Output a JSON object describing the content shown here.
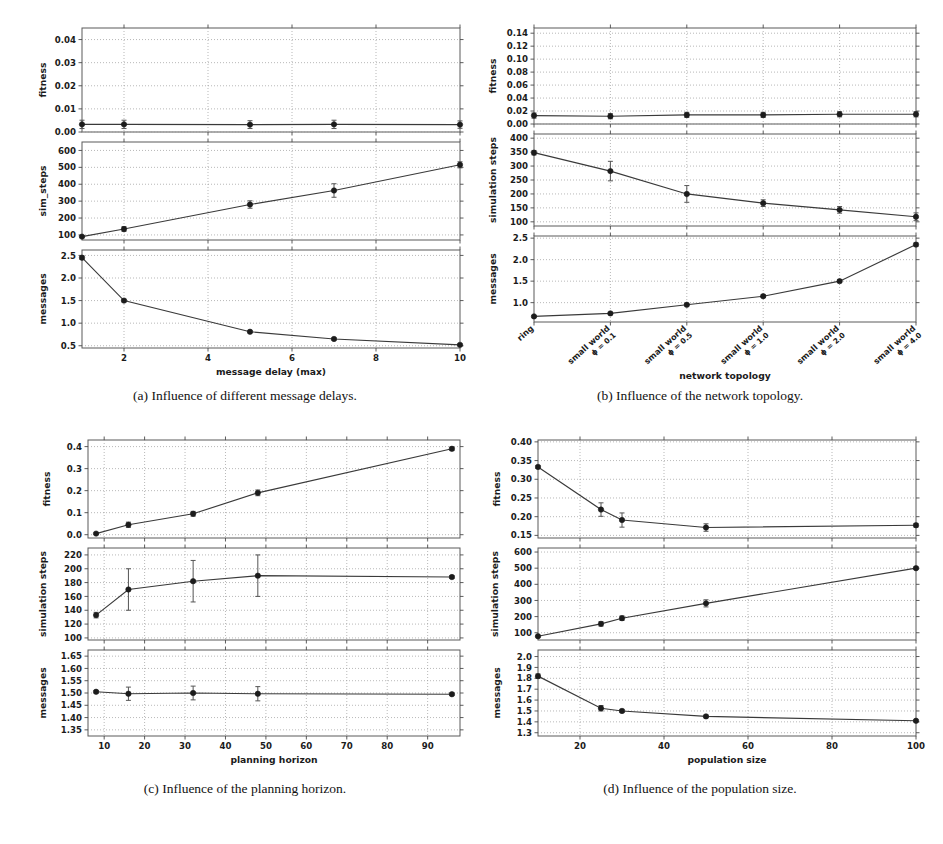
{
  "figure": {
    "subfigures": [
      {
        "id": "a",
        "caption": "(a) Influence of different message delays.",
        "xlabel": "message delay (max)",
        "panels": [
          "fitness",
          "sim_steps",
          "messages"
        ]
      },
      {
        "id": "b",
        "caption": "(b) Influence of the network topology.",
        "xlabel": "network topology",
        "panels": [
          "fitness",
          "simulation steps",
          "messages"
        ]
      },
      {
        "id": "c",
        "caption": "(c) Influence of the planning horizon.",
        "xlabel": "planning horizon",
        "panels": [
          "fitness",
          "simulation steps",
          "messages"
        ]
      },
      {
        "id": "d",
        "caption": "(d) Influence of the population size.",
        "xlabel": "population size",
        "panels": [
          "fitness",
          "simulation steps",
          "messages"
        ]
      }
    ]
  },
  "chart_data": [
    {
      "id": "a-fitness",
      "type": "line",
      "title": "",
      "xlabel": "",
      "ylabel": "fitness",
      "x": [
        1,
        2,
        5,
        7,
        10
      ],
      "values": [
        0.0033,
        0.0033,
        0.0032,
        0.0033,
        0.0032
      ],
      "yerr": [
        0.0018,
        0.0018,
        0.0017,
        0.0018,
        0.0016
      ],
      "xlim": [
        1,
        10
      ],
      "ylim": [
        0.0,
        0.045
      ],
      "yticks": [
        0.0,
        0.01,
        0.02,
        0.03,
        0.04
      ],
      "ytick_labels": [
        "0.00",
        "0.01",
        "0.02",
        "0.03",
        "0.04"
      ],
      "xticks": [
        2,
        4,
        6,
        8,
        10
      ],
      "xtick_labels": [
        "",
        "",
        "",
        "",
        ""
      ],
      "grid": true
    },
    {
      "id": "a-simsteps",
      "type": "line",
      "title": "",
      "xlabel": "",
      "ylabel": "sim_steps",
      "x": [
        1,
        2,
        5,
        7,
        10
      ],
      "values": [
        90,
        135,
        280,
        363,
        515
      ],
      "yerr": [
        6,
        14,
        22,
        40,
        18
      ],
      "xlim": [
        1,
        10
      ],
      "ylim": [
        70,
        650
      ],
      "yticks": [
        100,
        200,
        300,
        400,
        500,
        600
      ],
      "ytick_labels": [
        "100",
        "200",
        "300",
        "400",
        "500",
        "600"
      ],
      "xticks": [
        2,
        4,
        6,
        8,
        10
      ],
      "xtick_labels": [
        "",
        "",
        "",
        "",
        ""
      ],
      "grid": true
    },
    {
      "id": "a-messages",
      "type": "line",
      "title": "",
      "xlabel": "message delay (max)",
      "ylabel": "messages",
      "x": [
        1,
        2,
        5,
        7,
        10
      ],
      "values": [
        2.45,
        1.5,
        0.81,
        0.65,
        0.52
      ],
      "yerr": [
        0.04,
        0.03,
        0.02,
        0.02,
        0.02
      ],
      "xlim": [
        1,
        10
      ],
      "ylim": [
        0.45,
        2.62
      ],
      "yticks": [
        0.5,
        1.0,
        1.5,
        2.0,
        2.5
      ],
      "ytick_labels": [
        "0.5",
        "1.0",
        "1.5",
        "2.0",
        "2.5"
      ],
      "xticks": [
        2,
        4,
        6,
        8,
        10
      ],
      "xtick_labels": [
        "2",
        "4",
        "6",
        "8",
        "10"
      ],
      "grid": true
    },
    {
      "id": "b-fitness",
      "type": "line",
      "title": "",
      "xlabel": "",
      "ylabel": "fitness",
      "categories": [
        "ring",
        "small world\nφ = 0.1",
        "small world\nφ = 0.5",
        "small world\nφ = 1.0",
        "small world\nφ = 2.0",
        "small world\nφ = 4.0"
      ],
      "x": [
        0,
        1,
        2,
        3,
        4,
        5
      ],
      "values": [
        0.013,
        0.012,
        0.014,
        0.014,
        0.015,
        0.015
      ],
      "yerr": [
        0.004,
        0.004,
        0.004,
        0.004,
        0.004,
        0.004
      ],
      "xlim": [
        0,
        5
      ],
      "ylim": [
        0.0,
        0.148
      ],
      "yticks": [
        0.0,
        0.02,
        0.04,
        0.06,
        0.08,
        0.1,
        0.12,
        0.14
      ],
      "ytick_labels": [
        "0.00",
        "0.02",
        "0.04",
        "0.06",
        "0.08",
        "0.10",
        "0.12",
        "0.14"
      ],
      "grid": true
    },
    {
      "id": "b-simsteps",
      "type": "line",
      "title": "",
      "xlabel": "",
      "ylabel": "simulation steps",
      "x": [
        0,
        1,
        2,
        3,
        4,
        5
      ],
      "values": [
        348,
        282,
        200,
        167,
        143,
        118
      ],
      "yerr": [
        8,
        35,
        30,
        12,
        12,
        14
      ],
      "xlim": [
        0,
        5
      ],
      "ylim": [
        85,
        415
      ],
      "yticks": [
        100,
        150,
        200,
        250,
        300,
        350,
        400
      ],
      "ytick_labels": [
        "100",
        "150",
        "200",
        "250",
        "300",
        "350",
        "400"
      ],
      "grid": true
    },
    {
      "id": "b-messages",
      "type": "line",
      "title": "",
      "xlabel": "network topology",
      "ylabel": "messages",
      "x": [
        0,
        1,
        2,
        3,
        4,
        5
      ],
      "values": [
        0.68,
        0.75,
        0.95,
        1.15,
        1.5,
        2.35
      ],
      "yerr": [
        0.02,
        0.02,
        0.02,
        0.03,
        0.03,
        0.04
      ],
      "xlim": [
        0,
        5
      ],
      "ylim": [
        0.55,
        2.55
      ],
      "yticks": [
        1.0,
        1.5,
        2.0,
        2.5
      ],
      "ytick_labels": [
        "1.0",
        "1.5",
        "2.0",
        "2.5"
      ],
      "xtick_labels": [
        "ring",
        "small world",
        "small world",
        "small world",
        "small world",
        "small world"
      ],
      "xtick_sublabels": [
        "",
        "ϕ = 0.1",
        "ϕ = 0.5",
        "ϕ = 1.0",
        "ϕ = 2.0",
        "ϕ = 4.0"
      ],
      "grid": true
    },
    {
      "id": "c-fitness",
      "type": "line",
      "title": "",
      "xlabel": "",
      "ylabel": "fitness",
      "x": [
        8,
        16,
        32,
        48,
        96
      ],
      "values": [
        0.005,
        0.045,
        0.095,
        0.19,
        0.39
      ],
      "yerr": [
        0.004,
        0.012,
        0.011,
        0.013,
        0.008
      ],
      "xlim": [
        6,
        98
      ],
      "ylim": [
        -0.015,
        0.43
      ],
      "yticks": [
        0.0,
        0.1,
        0.2,
        0.3,
        0.4
      ],
      "ytick_labels": [
        "0.0",
        "0.1",
        "0.2",
        "0.3",
        "0.4"
      ],
      "xticks": [
        10,
        20,
        30,
        40,
        50,
        60,
        70,
        80,
        90
      ],
      "grid": true
    },
    {
      "id": "c-simsteps",
      "type": "line",
      "title": "",
      "xlabel": "",
      "ylabel": "simulation steps",
      "x": [
        8,
        16,
        32,
        48,
        96
      ],
      "values": [
        133,
        170,
        182,
        190,
        188
      ],
      "yerr": [
        4,
        30,
        30,
        30,
        2
      ],
      "xlim": [
        6,
        98
      ],
      "ylim": [
        97,
        230
      ],
      "yticks": [
        100,
        120,
        140,
        160,
        180,
        200,
        220
      ],
      "ytick_labels": [
        "100",
        "120",
        "140",
        "160",
        "180",
        "200",
        "220"
      ],
      "xticks": [
        10,
        20,
        30,
        40,
        50,
        60,
        70,
        80,
        90
      ],
      "grid": true
    },
    {
      "id": "c-messages",
      "type": "line",
      "title": "",
      "xlabel": "planning horizon",
      "ylabel": "messages",
      "x": [
        8,
        16,
        32,
        48,
        96
      ],
      "values": [
        1.505,
        1.497,
        1.5,
        1.497,
        1.495
      ],
      "yerr": [
        0.005,
        0.027,
        0.028,
        0.029,
        0.005
      ],
      "xlim": [
        6,
        98
      ],
      "ylim": [
        1.325,
        1.675
      ],
      "yticks": [
        1.35,
        1.4,
        1.45,
        1.5,
        1.55,
        1.6,
        1.65
      ],
      "ytick_labels": [
        "1.35",
        "1.40",
        "1.45",
        "1.50",
        "1.55",
        "1.60",
        "1.65"
      ],
      "xticks": [
        10,
        20,
        30,
        40,
        50,
        60,
        70,
        80,
        90
      ],
      "xtick_labels": [
        "10",
        "20",
        "30",
        "40",
        "50",
        "60",
        "70",
        "80",
        "90"
      ],
      "grid": true
    },
    {
      "id": "d-fitness",
      "type": "line",
      "title": "",
      "xlabel": "",
      "ylabel": "fitness",
      "x": [
        10,
        25,
        30,
        50,
        100
      ],
      "values": [
        0.333,
        0.219,
        0.191,
        0.171,
        0.177
      ],
      "yerr": [
        0.004,
        0.018,
        0.019,
        0.01,
        0.005
      ],
      "xlim": [
        10,
        100
      ],
      "ylim": [
        0.143,
        0.405
      ],
      "yticks": [
        0.15,
        0.2,
        0.25,
        0.3,
        0.35,
        0.4
      ],
      "ytick_labels": [
        "0.15",
        "0.20",
        "0.25",
        "0.30",
        "0.35",
        "0.40"
      ],
      "xticks": [
        20,
        40,
        60,
        80,
        100
      ],
      "grid": true
    },
    {
      "id": "d-simsteps",
      "type": "line",
      "title": "",
      "xlabel": "",
      "ylabel": "simulation steps",
      "x": [
        10,
        25,
        30,
        50,
        100
      ],
      "values": [
        78,
        155,
        190,
        282,
        500
      ],
      "yerr": [
        4,
        14,
        14,
        22,
        8
      ],
      "xlim": [
        10,
        100
      ],
      "ylim": [
        55,
        625
      ],
      "yticks": [
        100,
        200,
        300,
        400,
        500,
        600
      ],
      "ytick_labels": [
        "100",
        "200",
        "300",
        "400",
        "500",
        "600"
      ],
      "xticks": [
        20,
        40,
        60,
        80,
        100
      ],
      "grid": true
    },
    {
      "id": "d-messages",
      "type": "line",
      "title": "",
      "xlabel": "population size",
      "ylabel": "messages",
      "x": [
        10,
        25,
        30,
        50,
        100
      ],
      "values": [
        1.82,
        1.525,
        1.5,
        1.45,
        1.41
      ],
      "yerr": [
        0.02,
        0.025,
        0.015,
        0.012,
        0.008
      ],
      "xlim": [
        10,
        100
      ],
      "ylim": [
        1.27,
        2.06
      ],
      "yticks": [
        1.3,
        1.4,
        1.5,
        1.6,
        1.7,
        1.8,
        1.9,
        2.0
      ],
      "ytick_labels": [
        "1.3",
        "1.4",
        "1.5",
        "1.6",
        "1.7",
        "1.8",
        "1.9",
        "2.0"
      ],
      "xticks": [
        20,
        40,
        60,
        80,
        100
      ],
      "xtick_labels": [
        "20",
        "40",
        "60",
        "80",
        "100"
      ],
      "grid": true
    }
  ]
}
